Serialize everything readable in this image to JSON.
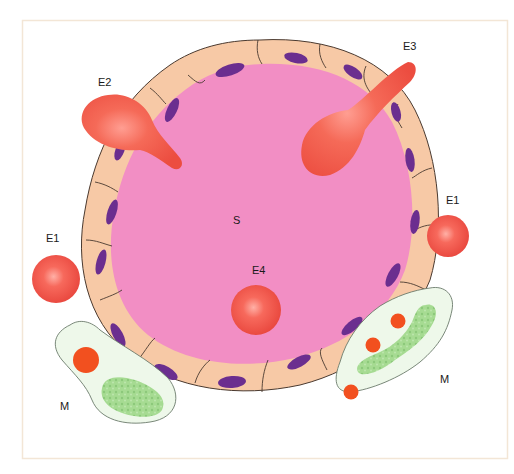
{
  "diagram": {
    "type": "histology-schematic",
    "labels": {
      "lumen": "S",
      "e1_left": "E1",
      "e1_right": "E1",
      "e2": "E2",
      "e3": "E3",
      "e4": "E4",
      "m_left": "M",
      "m_right": "M"
    },
    "colors": {
      "background": "#ffffff",
      "frame": "#f3e6d6",
      "lumen": "#f28ec4",
      "cell_cytoplasm": "#f7c9a6",
      "cell_outline": "#4a3a30",
      "nucleus": "#6b2e8f",
      "erythrocyte": "#f0554a",
      "erythrocyte_highlight": "#ff9b8e",
      "macrophage_body": "#eef8ea",
      "macrophage_outline": "#6b7a6b",
      "macrophage_granule": "#9fd68c",
      "ingested_cell": "#f2501f"
    }
  }
}
